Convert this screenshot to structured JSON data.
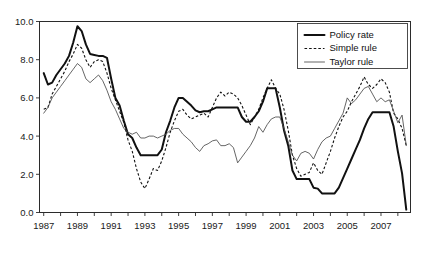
{
  "chart_data": {
    "type": "line",
    "title": "",
    "subtitle": "",
    "xlabel": "",
    "ylabel": "",
    "xlim": [
      1986.75,
      2008.75
    ],
    "ylim": [
      0.0,
      10.0
    ],
    "grid": false,
    "legend_position": "top-right",
    "y_ticks": [
      "0.0",
      "2.0",
      "4.0",
      "6.0",
      "8.0",
      "10.0"
    ],
    "y_tick_values": [
      0.0,
      2.0,
      4.0,
      6.0,
      8.0,
      10.0
    ],
    "x_ticks": [
      "1987",
      "1989",
      "1991",
      "1993",
      "1995",
      "1997",
      "1999",
      "2001",
      "2003",
      "2005",
      "2007"
    ],
    "x_tick_values": [
      1987,
      1989,
      1991,
      1993,
      1995,
      1997,
      1999,
      2001,
      2003,
      2005,
      2007
    ],
    "x_minor_tick_values": [
      1987,
      1988,
      1989,
      1990,
      1991,
      1992,
      1993,
      1994,
      1995,
      1996,
      1997,
      1998,
      1999,
      2000,
      2001,
      2002,
      2003,
      2004,
      2005,
      2006,
      2007,
      2008
    ],
    "x": [
      1987.0,
      1987.25,
      1987.5,
      1987.75,
      1988.0,
      1988.25,
      1988.5,
      1988.75,
      1989.0,
      1989.25,
      1989.5,
      1989.75,
      1990.0,
      1990.25,
      1990.5,
      1990.75,
      1991.0,
      1991.25,
      1991.5,
      1991.75,
      1992.0,
      1992.25,
      1992.5,
      1992.75,
      1993.0,
      1993.25,
      1993.5,
      1993.75,
      1994.0,
      1994.25,
      1994.5,
      1994.75,
      1995.0,
      1995.25,
      1995.5,
      1995.75,
      1996.0,
      1996.25,
      1996.5,
      1996.75,
      1997.0,
      1997.25,
      1997.5,
      1997.75,
      1998.0,
      1998.25,
      1998.5,
      1998.75,
      1999.0,
      1999.25,
      1999.5,
      1999.75,
      2000.0,
      2000.25,
      2000.5,
      2000.75,
      2001.0,
      2001.25,
      2001.5,
      2001.75,
      2002.0,
      2002.25,
      2002.5,
      2002.75,
      2003.0,
      2003.25,
      2003.5,
      2003.75,
      2004.0,
      2004.25,
      2004.5,
      2004.75,
      2005.0,
      2005.25,
      2005.5,
      2005.75,
      2006.0,
      2006.25,
      2006.5,
      2006.75,
      2007.0,
      2007.25,
      2007.5,
      2007.75,
      2008.0,
      2008.25,
      2008.5
    ],
    "series": [
      {
        "name": "Policy rate",
        "style": "solid-thick",
        "color": "#111111",
        "values": [
          7.3,
          6.7,
          6.8,
          7.2,
          7.5,
          7.8,
          8.2,
          8.9,
          9.75,
          9.5,
          8.8,
          8.3,
          8.25,
          8.2,
          8.2,
          8.1,
          7.0,
          6.0,
          5.6,
          4.8,
          4.1,
          3.9,
          3.4,
          3.0,
          3.0,
          3.0,
          3.0,
          3.0,
          3.3,
          4.2,
          4.8,
          5.5,
          6.0,
          6.0,
          5.8,
          5.6,
          5.35,
          5.25,
          5.3,
          5.3,
          5.4,
          5.5,
          5.5,
          5.5,
          5.5,
          5.5,
          5.5,
          5.0,
          4.75,
          4.75,
          5.0,
          5.3,
          5.8,
          6.5,
          6.5,
          6.5,
          5.5,
          4.3,
          3.5,
          2.2,
          1.75,
          1.75,
          1.75,
          1.75,
          1.3,
          1.25,
          1.0,
          1.0,
          1.0,
          1.0,
          1.3,
          1.8,
          2.3,
          2.8,
          3.3,
          3.8,
          4.4,
          4.9,
          5.25,
          5.25,
          5.25,
          5.25,
          5.25,
          4.5,
          3.2,
          2.05,
          0.15
        ]
      },
      {
        "name": "Simple rule",
        "style": "dashed",
        "color": "#111111",
        "values": [
          5.4,
          5.5,
          6.2,
          6.6,
          7.0,
          7.4,
          7.9,
          8.3,
          8.8,
          8.6,
          8.0,
          7.6,
          7.9,
          8.0,
          7.9,
          7.3,
          6.5,
          5.9,
          5.3,
          4.7,
          3.8,
          3.2,
          2.3,
          1.6,
          1.25,
          1.75,
          2.3,
          2.2,
          2.7,
          3.4,
          4.2,
          4.8,
          5.3,
          5.4,
          5.1,
          4.9,
          5.0,
          5.1,
          5.2,
          5.0,
          5.5,
          6.0,
          6.3,
          6.1,
          6.3,
          6.2,
          6.0,
          5.6,
          5.1,
          4.6,
          5.0,
          5.4,
          6.0,
          6.5,
          6.95,
          6.5,
          6.2,
          5.4,
          4.3,
          3.0,
          2.3,
          1.9,
          2.0,
          2.1,
          2.6,
          2.2,
          2.0,
          2.6,
          3.2,
          3.9,
          4.5,
          5.0,
          5.3,
          5.8,
          6.2,
          6.6,
          7.1,
          6.7,
          6.5,
          6.7,
          7.0,
          6.8,
          6.3,
          5.2,
          4.9,
          4.4,
          3.5
        ]
      },
      {
        "name": "Taylor rule",
        "style": "solid-thin",
        "color": "#4a4a4a",
        "values": [
          5.2,
          5.5,
          6.0,
          6.3,
          6.6,
          6.9,
          7.2,
          7.5,
          7.8,
          7.6,
          7.0,
          6.8,
          7.0,
          7.2,
          6.9,
          6.4,
          5.8,
          5.4,
          4.9,
          4.4,
          4.2,
          4.1,
          4.2,
          3.9,
          3.9,
          4.0,
          4.0,
          3.9,
          4.0,
          4.1,
          4.3,
          4.4,
          4.4,
          4.1,
          3.9,
          3.7,
          3.4,
          3.2,
          3.5,
          3.6,
          3.75,
          3.8,
          3.5,
          3.5,
          3.6,
          3.4,
          2.6,
          2.9,
          3.2,
          3.5,
          3.9,
          4.5,
          4.2,
          4.6,
          4.9,
          5.0,
          5.0,
          4.4,
          3.7,
          3.0,
          2.7,
          3.1,
          3.2,
          3.1,
          2.8,
          3.3,
          3.7,
          3.9,
          4.0,
          4.4,
          4.8,
          5.2,
          6.0,
          5.7,
          5.9,
          6.2,
          6.5,
          6.6,
          6.2,
          5.8,
          6.0,
          5.8,
          5.9,
          5.3,
          4.7,
          5.1,
          3.5
        ]
      }
    ]
  },
  "legend": {
    "items": [
      {
        "label": "Policy rate",
        "style": "solid-thick"
      },
      {
        "label": "Simple rule",
        "style": "dashed"
      },
      {
        "label": "Taylor rule",
        "style": "solid-thin"
      }
    ]
  }
}
